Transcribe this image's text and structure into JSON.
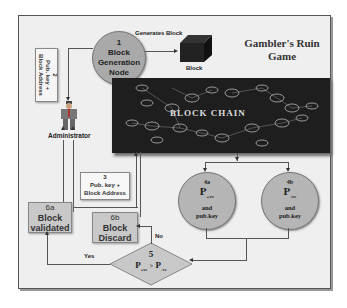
{
  "title": {
    "line1": "Gambler's Ruin",
    "line2": "Game"
  },
  "nodes": {
    "block_gen": {
      "num": "1",
      "line1": "Block",
      "line2": "Generation",
      "line3": "Node"
    },
    "block": {
      "label": "Block"
    },
    "generates_label": "Generates Block",
    "step2": {
      "num": "2",
      "line1": "Pub. key +",
      "line2": "Block Address"
    },
    "administrator": {
      "label": "Administrator"
    },
    "blockchain": {
      "label": "BLOCK CHAIN"
    },
    "step3": {
      "num": "3",
      "line1": "Pub. key +",
      "line2": "Block Address"
    },
    "step4a": {
      "num": "4a",
      "p": "P",
      "sub": "+ve",
      "and": "and",
      "key": "pub.key"
    },
    "step4b": {
      "num": "4b",
      "p": "P",
      "sub": "-ve",
      "and": "and",
      "key": "pub.key"
    },
    "step5": {
      "num": "5",
      "p1": "P",
      "sub1": "+ve",
      "gt": ">",
      "p2": "P",
      "sub2": "-ve"
    },
    "step6a": {
      "num": "6a",
      "line1": "Block",
      "line2": "validated"
    },
    "step6b": {
      "num": "6b",
      "line1": "Block",
      "line2": "Discard"
    },
    "yes_label": "Yes",
    "no_label": "No"
  },
  "colors": {
    "node_fill": "#b5b5b5",
    "box_fill": "#c8c8c8",
    "chain_bg": "#1e1e1e",
    "frame_bg": "#efefef"
  }
}
